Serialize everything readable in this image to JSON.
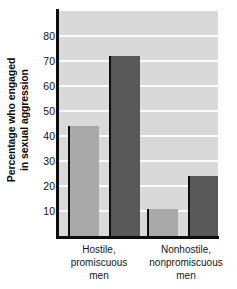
{
  "chart_data": {
    "type": "bar",
    "title": "",
    "xlabel": "",
    "ylabel_line1": "Percentage who engaged",
    "ylabel_line2": "in sexual aggression",
    "ylabel": "Percentage who engaged in sexual aggression",
    "categories": [
      {
        "line1": "Hostile,",
        "line2": "promiscuous",
        "line3": "men"
      },
      {
        "line1": "Nonhostile,",
        "line2": "nonpromiscuous",
        "line3": "men"
      }
    ],
    "category_labels": [
      "Hostile, promiscuous men",
      "Nonhostile, nonpromiscuous men"
    ],
    "series": [
      {
        "name": "light",
        "color": "#a9a9a9",
        "values": [
          44,
          11
        ]
      },
      {
        "name": "dark",
        "color": "#595959",
        "values": [
          72,
          24
        ]
      }
    ],
    "yticks": [
      80,
      70,
      60,
      50,
      40,
      30,
      20,
      10
    ],
    "ylim": [
      0,
      90
    ],
    "grid": true,
    "legend": "none",
    "colors": {
      "plot_background": "#d9d9d9",
      "gridline": "#fbfbfb",
      "axis": "#0d0d0d",
      "bar_light": "#a9a9a9",
      "bar_dark": "#595959",
      "page_background": "#ffffff"
    }
  }
}
